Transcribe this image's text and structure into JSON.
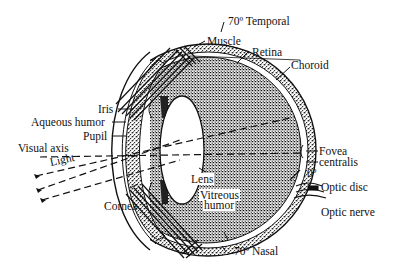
{
  "diagram": {
    "colors": {
      "ink": "#111111",
      "paper": "#ffffff",
      "stipple": "#555555"
    },
    "labels": {
      "temporal": "70º Temporal",
      "muscle": "Muscle",
      "retina": "Retina",
      "choroid": "Choroid",
      "iris": "Iris",
      "aqueous_humor": "Aqueous humor",
      "pupil": "Pupil",
      "visual_axis": "Visual axis",
      "light": "Light",
      "fovea_line1": "Fovea",
      "fovea_line2": "centralis",
      "zero_deg": "0º",
      "optic_disc": "Optic disc",
      "optic_nerve": "Optic nerve",
      "lens": "Lens",
      "vitreous_line1": "Vitreous",
      "vitreous_line2": "humor",
      "cornea": "Cornea",
      "nasal": "70º Nasal"
    }
  }
}
